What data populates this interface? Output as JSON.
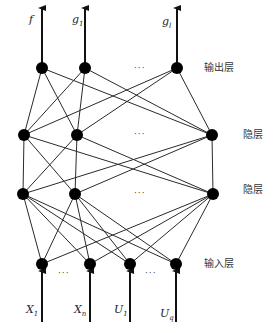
{
  "diagram": {
    "type": "neural-network",
    "layers": [
      {
        "name": "output",
        "label": "输出层",
        "y": 68,
        "nodes": [
          42,
          85,
          177
        ],
        "ellipsis_x": 134
      },
      {
        "name": "hidden1",
        "label": "隐层",
        "y": 135,
        "nodes": [
          24,
          77,
          212
        ],
        "ellipsis_x": 144
      },
      {
        "name": "hidden2",
        "label": "隐层",
        "y": 194,
        "nodes": [
          23,
          75,
          213
        ],
        "ellipsis_x": 144
      },
      {
        "name": "input",
        "label": "输入层",
        "y": 264,
        "nodes": [
          42,
          90,
          130,
          176
        ],
        "ellipsis_positions": [
          66,
          153
        ]
      }
    ],
    "outputs": [
      {
        "base": "f",
        "sub": "",
        "x": 42
      },
      {
        "base": "g",
        "sub": "1",
        "x": 85
      },
      {
        "base": "g",
        "sub": "l",
        "x": 177
      }
    ],
    "inputs": [
      {
        "base": "X",
        "sub": "1",
        "x": 42
      },
      {
        "base": "X",
        "sub": "n",
        "x": 90
      },
      {
        "base": "U",
        "sub": "1",
        "x": 130
      },
      {
        "base": "U",
        "sub": "q",
        "x": 176
      }
    ],
    "labels": {
      "output_layer": "输出层",
      "hidden_layer_1": "隐层",
      "hidden_layer_2": "隐层",
      "input_layer": "输入层",
      "ellipsis": "···"
    },
    "colors": {
      "node": "#000000",
      "edge": "#2a2a2a",
      "background": "#ffffff"
    }
  }
}
